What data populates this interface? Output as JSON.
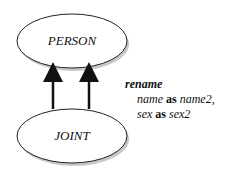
{
  "diagram": {
    "nodes": [
      {
        "id": "person",
        "label": "PERSON"
      },
      {
        "id": "joint",
        "label": "JOINT"
      }
    ],
    "edges": [
      {
        "from": "joint",
        "to": "person",
        "count": 2
      }
    ],
    "annotation": {
      "keyword": "rename",
      "lines": [
        {
          "attr": "name",
          "as": "as",
          "new": "name2,"
        },
        {
          "attr": "sex",
          "as": "as",
          "new": "sex2"
        }
      ]
    }
  }
}
